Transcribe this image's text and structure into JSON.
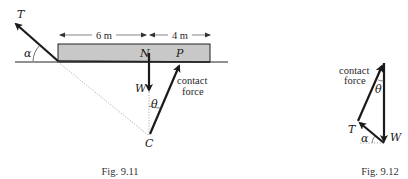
{
  "figures": [
    {
      "caption": "Fig. 9.11",
      "dimensions": {
        "left": "6 m",
        "right": "4 m"
      },
      "labels": {
        "tension": "T",
        "alpha": "α",
        "point_n": "N",
        "point_p": "P",
        "weight": "W",
        "theta": "θ",
        "point_c": "C",
        "contact_line1": "contact",
        "contact_line2": "force"
      }
    },
    {
      "caption": "Fig. 9.12",
      "labels": {
        "contact_line1": "contact",
        "contact_line2": "force",
        "theta": "θ",
        "tension": "T",
        "alpha": "α",
        "weight": "W"
      }
    }
  ],
  "colors": {
    "beam_fill": "#c8c8c8",
    "line": "#1a1a1a",
    "dotted": "#8a8a8a"
  }
}
